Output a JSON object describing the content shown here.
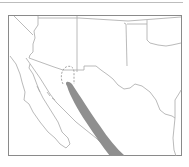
{
  "map": {
    "type": "species-range-map",
    "region": "Southwestern United States and northern Mexico",
    "colors": {
      "background": "#ffffff",
      "frame": "#8a8a8a",
      "borders": "#a8a8a8",
      "range_fill": "#8f8f8f",
      "top_rule": "#bdbdbd"
    },
    "layers": [
      {
        "name": "state-and-country-borders",
        "style": "solid"
      },
      {
        "name": "coastline",
        "style": "solid"
      },
      {
        "name": "species-range",
        "style": "filled-gray"
      },
      {
        "name": "possible-range-extension",
        "style": "dashed-outline"
      }
    ]
  }
}
